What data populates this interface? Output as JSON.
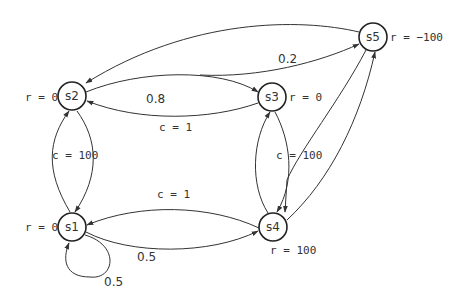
{
  "diagram": {
    "type": "markov-decision-process",
    "nodes": [
      {
        "id": "s1",
        "label": "s1",
        "reward": "r = 0"
      },
      {
        "id": "s2",
        "label": "s2",
        "reward": "r = 0"
      },
      {
        "id": "s3",
        "label": "s3",
        "reward": "r = 0"
      },
      {
        "id": "s4",
        "label": "s4",
        "reward": "r = 100"
      },
      {
        "id": "s5",
        "label": "s5",
        "reward": "r = −100"
      }
    ],
    "edges": [
      {
        "from": "s5",
        "to": "s2",
        "label": ""
      },
      {
        "from": "s2",
        "to": "s3",
        "label": "0.8"
      },
      {
        "from": "s2",
        "to": "s5",
        "label": "0.2"
      },
      {
        "from": "s3",
        "to": "s2",
        "label": "c = 1"
      },
      {
        "from": "s2",
        "to": "s1",
        "label": "c = 100"
      },
      {
        "from": "s1",
        "to": "s2",
        "label": ""
      },
      {
        "from": "s4",
        "to": "s1",
        "label": "c = 1"
      },
      {
        "from": "s1",
        "to": "s4",
        "label": "0.5"
      },
      {
        "from": "s1",
        "to": "s1",
        "label": "0.5"
      },
      {
        "from": "s3",
        "to": "s4",
        "label": "c = 100"
      },
      {
        "from": "s5",
        "to": "s4",
        "label": ""
      },
      {
        "from": "s4",
        "to": "s3",
        "label": ""
      },
      {
        "from": "s4",
        "to": "s5",
        "label": ""
      }
    ],
    "edge_labels": {
      "s2_s3": "0.8",
      "s2_s5": "0.2",
      "s3_s2": "c = 1",
      "s2_s1": "c = 100",
      "s4_s1": "c = 1",
      "s1_s4": "0.5",
      "s1_loop": "0.5",
      "s3_s4": "c = 100"
    },
    "colors": {
      "stroke": "#333333",
      "background": "#ffffff"
    }
  }
}
